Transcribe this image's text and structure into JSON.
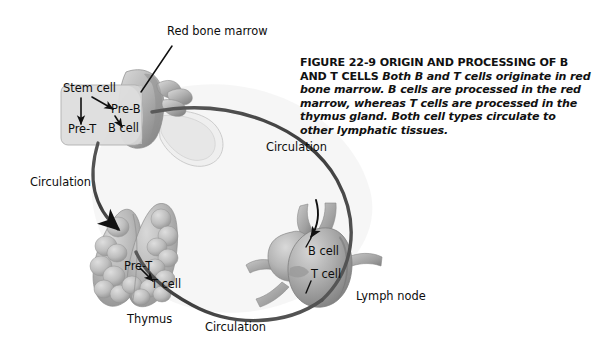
{
  "figure": {
    "caption": {
      "heading": "FIGURE 22-9 ORIGIN AND PROCESSING OF B AND T CELLS",
      "body": " Both B and T cells originate in red bone marrow. B cells are processed in the red marrow, whereas T cells are processed in the thymus gland. Both cell types circulate to other lymphatic tissues.",
      "figure_number": "22-9",
      "title": "ORIGIN AND PROCESSING OF B AND T CELLS"
    },
    "labels": {
      "red_bone_marrow": "Red bone marrow",
      "stem_cell": "Stem cell",
      "pre_b": "Pre-B",
      "pre_t_marrow": "Pre-T",
      "b_cell_marrow": "B cell",
      "pre_t_thymus": "Pre-T",
      "t_cell_thymus": "T cell",
      "thymus": "Thymus",
      "b_cell_node": "B cell",
      "t_cell_node": "T cell",
      "lymph_node": "Lymph node",
      "circulation_left": "Circulation",
      "circulation_right": "Circulation",
      "circulation_bottom": "Circulation"
    },
    "colors": {
      "background": "#ffffff",
      "text": "#111111",
      "marrow_box": "#dcdcdc",
      "marrow_box_edge": "#a8a8a8",
      "bone_light": "#cfcfcf",
      "bone_mid": "#9a9a9a",
      "bone_dark": "#6f6f6f",
      "thymus_light": "#cbcbcb",
      "thymus_mid": "#a6a6a6",
      "thymus_dark": "#7d7d7d",
      "node_light": "#c6c6c6",
      "node_mid": "#9c9c9c",
      "node_dark": "#6a6a6a",
      "vessel": "#4a4a4a",
      "loop_fill": "#f4f4f4",
      "arrow": "#101010",
      "leader": "#101010"
    }
  }
}
